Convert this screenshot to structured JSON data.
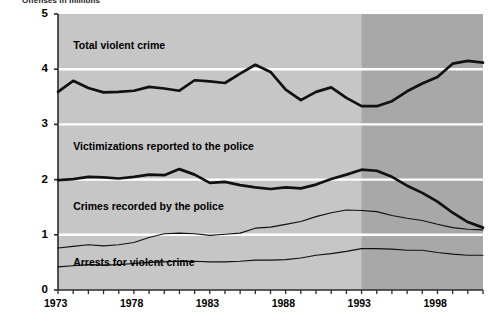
{
  "figure": {
    "axis_title": "Offenses in millions"
  },
  "chart_data": {
    "type": "line",
    "title": "Offenses in millions",
    "xlabel": "",
    "ylabel": "Offenses in millions",
    "xlim": [
      1973,
      2001
    ],
    "ylim": [
      0,
      5
    ],
    "grid": "horizontal white gridlines at 1, 2, 3, 4",
    "legend": "inline labels placed above each line",
    "x_ticks": [
      1973,
      1974,
      1975,
      1976,
      1977,
      1978,
      1979,
      1980,
      1981,
      1982,
      1983,
      1984,
      1985,
      1986,
      1987,
      1988,
      1989,
      1990,
      1991,
      1992,
      1993,
      1994,
      1995,
      1996,
      1997,
      1998,
      1999,
      2000,
      2001
    ],
    "x_tick_labels": [
      "1973",
      "1978",
      "1983",
      "1988",
      "1993",
      "1998"
    ],
    "x_tick_label_values": [
      1973,
      1978,
      1983,
      1988,
      1993,
      1998
    ],
    "y_ticks": [
      0,
      1,
      2,
      3,
      4,
      5
    ],
    "y_tick_labels": [
      "0",
      "1",
      "2",
      "3",
      "4",
      "5"
    ],
    "shaded_region": {
      "label": "redesigned survey period",
      "from": 1993,
      "to": 2001,
      "color": "#a8a8a8"
    },
    "plot_background": "#c6c6c6",
    "x": [
      1973,
      1974,
      1975,
      1976,
      1977,
      1978,
      1979,
      1980,
      1981,
      1982,
      1983,
      1984,
      1985,
      1986,
      1987,
      1988,
      1989,
      1990,
      1991,
      1992,
      1993,
      1994,
      1995,
      1996,
      1997,
      1998,
      1999,
      2000,
      2001
    ],
    "series": [
      {
        "name": "Total violent crime",
        "style": "thick",
        "color": "#111111",
        "values": [
          3.59,
          3.79,
          3.66,
          3.58,
          3.59,
          3.61,
          3.68,
          3.65,
          3.61,
          3.8,
          3.78,
          3.75,
          3.92,
          4.08,
          3.95,
          3.63,
          3.44,
          3.59,
          3.67,
          3.48,
          3.33,
          3.33,
          3.42,
          3.6,
          3.74,
          3.86,
          4.1,
          4.15,
          4.12
        ]
      },
      {
        "name": "Victimizations reported to the police",
        "style": "thick",
        "color": "#111111",
        "values": [
          1.99,
          2.01,
          2.05,
          2.04,
          2.02,
          2.05,
          2.09,
          2.08,
          2.19,
          2.09,
          1.94,
          1.96,
          1.9,
          1.86,
          1.83,
          1.86,
          1.84,
          1.91,
          2.01,
          2.09,
          2.18,
          2.16,
          2.05,
          1.89,
          1.76,
          1.6,
          1.4,
          1.23,
          1.13
        ]
      },
      {
        "name": "Crimes recorded by the police",
        "style": "thin",
        "color": "#111111",
        "values": [
          0.76,
          0.79,
          0.82,
          0.8,
          0.82,
          0.86,
          0.95,
          1.02,
          1.03,
          1.02,
          0.99,
          1.01,
          1.03,
          1.12,
          1.14,
          1.19,
          1.24,
          1.33,
          1.4,
          1.45,
          1.44,
          1.42,
          1.35,
          1.3,
          1.26,
          1.19,
          1.13,
          1.1,
          1.09
        ]
      },
      {
        "name": "Arrests for violent crime",
        "style": "thin",
        "color": "#111111",
        "values": [
          0.42,
          0.44,
          0.46,
          0.45,
          0.46,
          0.48,
          0.5,
          0.51,
          0.52,
          0.52,
          0.51,
          0.51,
          0.52,
          0.54,
          0.54,
          0.55,
          0.58,
          0.63,
          0.66,
          0.7,
          0.75,
          0.75,
          0.74,
          0.72,
          0.72,
          0.68,
          0.65,
          0.63,
          0.63
        ]
      }
    ],
    "annotations": [
      {
        "text": "Total violent crime",
        "x": 1974.0,
        "y": 4.44
      },
      {
        "text": "Victimizations reported to the police",
        "x": 1974.0,
        "y": 2.6
      },
      {
        "text": "Crimes recorded by the police",
        "x": 1974.0,
        "y": 1.52
      },
      {
        "text": "Arrests for violent crime",
        "x": 1974.0,
        "y": 0.5
      }
    ]
  }
}
